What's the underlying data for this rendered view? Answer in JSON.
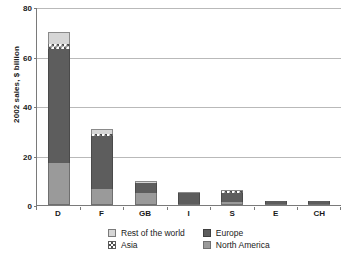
{
  "chart_data": {
    "type": "bar",
    "stacked": true,
    "title": "",
    "xlabel": "",
    "ylabel": "2002 sales, $ billion",
    "ylim": [
      0,
      80
    ],
    "yticks": [
      0,
      20,
      40,
      60,
      80
    ],
    "ytick_labels": [
      "0",
      "20",
      "40",
      "60",
      "80"
    ],
    "grid": true,
    "legend_position": "bottom",
    "categories": [
      "D",
      "F",
      "GB",
      "I",
      "S",
      "E",
      "CH"
    ],
    "series": [
      {
        "name": "North America",
        "color": "#9a9a9a",
        "values": [
          17.0,
          6.5,
          5.0,
          0.5,
          1.2,
          0.3,
          0.3
        ]
      },
      {
        "name": "Europe",
        "color": "#5d5d5d",
        "values": [
          46.0,
          21.5,
          4.0,
          4.4,
          3.5,
          1.0,
          1.2
        ]
      },
      {
        "name": "Asia",
        "color": "#ffffff",
        "values": [
          2.0,
          0.7,
          0.0,
          0.0,
          0.8,
          0.0,
          0.0
        ]
      },
      {
        "name": "Rest of the world",
        "color": "#d6d6d6",
        "values": [
          5.0,
          2.0,
          0.7,
          0.3,
          0.5,
          0.0,
          0.0
        ]
      }
    ],
    "totals": [
      70.0,
      30.7,
      9.7,
      5.2,
      6.0,
      1.3,
      1.5
    ]
  },
  "legend": {
    "items": [
      {
        "label": "Rest of the world",
        "swatch": "rw"
      },
      {
        "label": "Europe",
        "swatch": "eu"
      },
      {
        "label": "Asia",
        "swatch": "asia"
      },
      {
        "label": "North America",
        "swatch": "na"
      }
    ]
  },
  "axis": {
    "y_title": "2002 sales, $ billion"
  }
}
